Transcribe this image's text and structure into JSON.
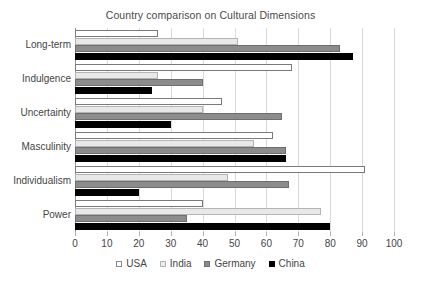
{
  "chart_data": {
    "type": "bar",
    "orientation": "horizontal",
    "title": "Country comparison on Cultural Dimensions",
    "xlabel": "",
    "ylabel": "",
    "xlim": [
      0,
      100
    ],
    "xticks": [
      0,
      10,
      20,
      30,
      40,
      50,
      60,
      70,
      80,
      90,
      100
    ],
    "grid": true,
    "legend_position": "bottom",
    "categories": [
      "Long-term",
      "Indulgence",
      "Uncertainty",
      "Masculinity",
      "Individualism",
      "Power"
    ],
    "series": [
      {
        "name": "USA",
        "color": "#ffffff",
        "values": [
          26,
          68,
          46,
          62,
          91,
          40
        ]
      },
      {
        "name": "India",
        "color": "#ececec",
        "values": [
          51,
          26,
          40,
          56,
          48,
          77
        ]
      },
      {
        "name": "Germany",
        "color": "#8c8c8c",
        "values": [
          83,
          40,
          65,
          66,
          67,
          35
        ]
      },
      {
        "name": "China",
        "color": "#000000",
        "values": [
          87,
          24,
          30,
          66,
          20,
          80
        ]
      }
    ]
  },
  "legend": {
    "items": [
      {
        "label": "USA",
        "swatch": "legend-swatch-usa"
      },
      {
        "label": "India",
        "swatch": "legend-swatch-india"
      },
      {
        "label": "Germany",
        "swatch": "legend-swatch-germany"
      },
      {
        "label": "China",
        "swatch": "legend-swatch-china"
      }
    ]
  }
}
